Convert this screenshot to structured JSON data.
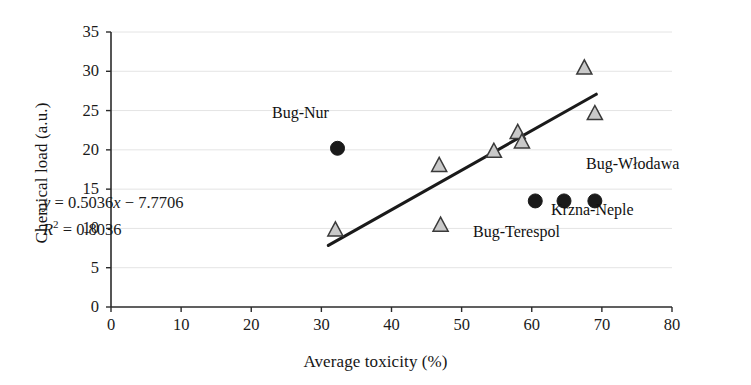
{
  "chart_data": {
    "type": "scatter",
    "title": "",
    "xlabel": "Average toxicity (%)",
    "ylabel": "Chemical load (a.u.)",
    "xlim": [
      0,
      80
    ],
    "ylim": [
      0,
      35
    ],
    "xticks": [
      0,
      10,
      20,
      30,
      40,
      50,
      60,
      70,
      80
    ],
    "yticks": [
      0,
      5,
      10,
      15,
      20,
      25,
      30,
      35
    ],
    "grid": "horizontal",
    "legend": "none",
    "series": [
      {
        "name": "open-triangle-sites",
        "marker": "open-triangle",
        "color": "#c9c9c9",
        "edge_color": "#3a3a3a",
        "points": [
          {
            "x": 32.0,
            "y": 9.8
          },
          {
            "x": 46.8,
            "y": 18.0
          },
          {
            "x": 47.0,
            "y": 10.4
          },
          {
            "x": 54.6,
            "y": 19.8
          },
          {
            "x": 58.0,
            "y": 22.2
          },
          {
            "x": 58.6,
            "y": 21.0
          },
          {
            "x": 67.5,
            "y": 30.4
          },
          {
            "x": 69.0,
            "y": 24.6
          }
        ]
      },
      {
        "name": "filled-circle-sites",
        "marker": "filled-circle",
        "color": "#1a1a1a",
        "edge_color": "#1a1a1a",
        "points": [
          {
            "x": 32.3,
            "y": 20.2,
            "label": "Bug-Nur"
          },
          {
            "x": 60.5,
            "y": 13.5,
            "label": "Bug-Terespol"
          },
          {
            "x": 64.6,
            "y": 13.5,
            "label": "Krzna-Neple"
          },
          {
            "x": 69.0,
            "y": 13.5,
            "label": "Bug-Włodawa"
          }
        ]
      }
    ],
    "trendline": {
      "type": "linear",
      "slope": 0.5036,
      "intercept": -7.7706,
      "x_start": 31.0,
      "x_end": 69.2,
      "color": "#1a1a1a",
      "equation": "y = 0.5036x − 7.7706",
      "r_squared": 0.8036,
      "r_squared_text": "R2 = 0.8036"
    },
    "annotations": [
      {
        "name": "bug-nur",
        "text": "Bug-Nur",
        "x_px": 272,
        "y_px": 113
      },
      {
        "name": "bug-wlodawa",
        "text": "Bug-Włodawa",
        "x_px": 586,
        "y_px": 164
      },
      {
        "name": "krzna-neple",
        "text": "Krzna-Neple",
        "x_px": 551,
        "y_px": 210
      },
      {
        "name": "bug-terespol",
        "text": "Bug-Terespol",
        "x_px": 473,
        "y_px": 232
      },
      {
        "name": "equation",
        "text": "y = 0.5036x − 7.7706",
        "x_px": 43,
        "y_px": 201
      },
      {
        "name": "r-squared",
        "text": "R2 = 0.8036",
        "x_px": 43,
        "y_px": 225
      }
    ]
  },
  "axes": {
    "x": {
      "label": "Average toxicity (%)",
      "ticks": [
        "0",
        "10",
        "20",
        "30",
        "40",
        "50",
        "60",
        "70",
        "80"
      ]
    },
    "y": {
      "label": "Chemical load (a.u.)",
      "ticks": [
        "0",
        "5",
        "10",
        "15",
        "20",
        "25",
        "30",
        "35"
      ]
    }
  },
  "equation": {
    "lhs": "y",
    "eq": " = 0.5036",
    "var": "x",
    "rest": " − 7.7706",
    "r_symbol": "R",
    "r_exp": "2",
    "r_value": " = 0.8036"
  },
  "labels": {
    "bug_nur": "Bug-Nur",
    "bug_wlodawa": "Bug-Włodawa",
    "krzna_neple": "Krzna-Neple",
    "bug_terespol": "Bug-Terespol"
  }
}
